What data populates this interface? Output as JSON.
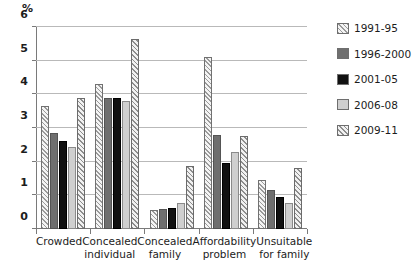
{
  "chart_data": {
    "type": "bar",
    "title": "",
    "subtitle": "",
    "xlabel": "",
    "ylabel": "%",
    "ylim": [
      0,
      6
    ],
    "yticks": [
      0,
      1,
      2,
      3,
      4,
      5,
      6
    ],
    "ytick_labels": [
      "0",
      "1",
      "2",
      "3",
      "4",
      "5",
      "6"
    ],
    "grid": "horizontal",
    "legend_position": "right",
    "categories": [
      "Crowded",
      "Concealed individual",
      "Concealed family",
      "Affordability problem",
      "Unsuitable for family"
    ],
    "category_lines": [
      [
        "Crowded"
      ],
      [
        "Concealed",
        "individual"
      ],
      [
        "Concealed",
        "family"
      ],
      [
        "Affordability",
        "problem"
      ],
      [
        "Unsuitable",
        "for family"
      ]
    ],
    "series": [
      {
        "name": "1991-95",
        "color": "#f2f2f2",
        "pattern": "diagonal-hatch-light",
        "values": [
          3.65,
          4.3,
          0.55,
          5.1,
          1.45
        ]
      },
      {
        "name": "1996-2000",
        "color": "#6f6f6f",
        "pattern": "solid",
        "values": [
          2.85,
          3.9,
          0.6,
          2.8,
          1.15
        ]
      },
      {
        "name": "2001-05",
        "color": "#111111",
        "pattern": "solid",
        "values": [
          2.6,
          3.9,
          0.62,
          1.95,
          0.95
        ]
      },
      {
        "name": "2006-08",
        "color": "#cfcfcf",
        "pattern": "solid",
        "values": [
          2.45,
          3.8,
          0.78,
          2.3,
          0.78
        ]
      },
      {
        "name": "2009-11",
        "color": "#ededed",
        "pattern": "diagonal-hatch",
        "values": [
          3.9,
          5.65,
          1.88,
          2.75,
          1.8
        ]
      }
    ]
  },
  "axis": {
    "unit_label": "%"
  }
}
